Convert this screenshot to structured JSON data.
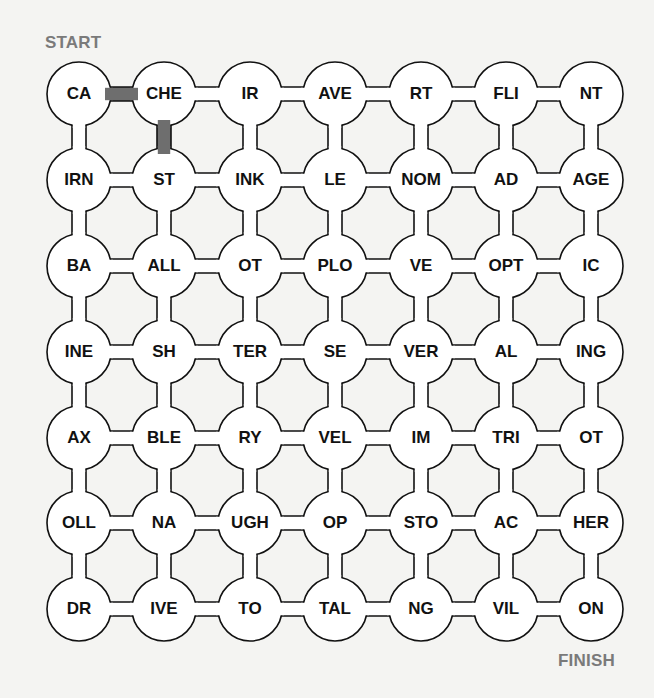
{
  "puzzle": {
    "start_label": "START",
    "finish_label": "FINISH",
    "grid": [
      [
        "CA",
        "CHE",
        "IR",
        "AVE",
        "RT",
        "FLI",
        "NT"
      ],
      [
        "IRN",
        "ST",
        "INK",
        "LE",
        "NOM",
        "AD",
        "AGE"
      ],
      [
        "BA",
        "ALL",
        "OT",
        "PLO",
        "VE",
        "OPT",
        "IC"
      ],
      [
        "INE",
        "SH",
        "TER",
        "SE",
        "VER",
        "AL",
        "ING"
      ],
      [
        "AX",
        "BLE",
        "RY",
        "VEL",
        "IM",
        "TRI",
        "OT"
      ],
      [
        "OLL",
        "NA",
        "UGH",
        "OP",
        "STO",
        "AC",
        "HER"
      ],
      [
        "DR",
        "IVE",
        "TO",
        "TAL",
        "NG",
        "VIL",
        "ON"
      ]
    ],
    "filled_connections": [
      {
        "from": [
          0,
          0
        ],
        "to": [
          0,
          1
        ]
      },
      {
        "from": [
          0,
          1
        ],
        "to": [
          1,
          1
        ]
      }
    ],
    "colors": {
      "background": "#f4f4f2",
      "line": "#111111",
      "fill_path": "#6e6e6e",
      "label": "#7a7a7a"
    }
  }
}
